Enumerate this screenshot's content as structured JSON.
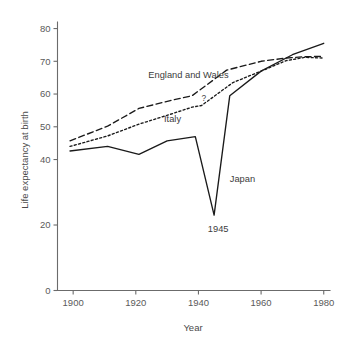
{
  "chart_data": {
    "type": "line",
    "title": "",
    "xlabel": "Year",
    "ylabel": "Life expectancy at birth",
    "xlim": [
      1895,
      1982
    ],
    "ylim": [
      0,
      82
    ],
    "grid": false,
    "legend_position": "inline-annotations",
    "xticks": [
      1900,
      1920,
      1940,
      1960,
      1980
    ],
    "xtick_labels": [
      "1900",
      "1920",
      "1940",
      "1960",
      "1980"
    ],
    "yticks": [
      0,
      20,
      40,
      50,
      60,
      70,
      80
    ],
    "ytick_labels": [
      "0",
      "20",
      "40",
      "50",
      "60",
      "70",
      "80"
    ],
    "series": [
      {
        "name": "England and Wales",
        "style": "dashed",
        "label_x": 1924,
        "label_y": 65.0,
        "x": [
          1899,
          1911,
          1921,
          1931,
          1938,
          1949,
          1960,
          1968,
          1974,
          1980
        ],
        "values": [
          45.7,
          50.2,
          55.6,
          58.0,
          59.5,
          67.3,
          70.0,
          71.0,
          71.4,
          71.5
        ]
      },
      {
        "name": "Italy",
        "style": "dotted",
        "label_x": 1929,
        "label_y": 51.5,
        "x": [
          1899,
          1911,
          1921,
          1931,
          1938,
          1941,
          1951,
          1960,
          1968,
          1974,
          1980
        ],
        "values": [
          44.0,
          47.2,
          50.8,
          53.8,
          56.0,
          56.5,
          63.5,
          67.0,
          70.2,
          71.2,
          71.0
        ]
      },
      {
        "name": "Japan",
        "style": "solid",
        "label_x": 1950,
        "label_y": 33.0,
        "x": [
          1899,
          1911,
          1921,
          1930,
          1939,
          1945,
          1950,
          1960,
          1970,
          1980
        ],
        "values": [
          42.6,
          44.0,
          41.6,
          45.7,
          47.0,
          23.0,
          59.5,
          67.0,
          72.0,
          75.5
        ]
      }
    ],
    "annotations": [
      {
        "text": "?",
        "x": 1941,
        "y": 57.8,
        "size": "small"
      },
      {
        "text": "1945",
        "x": 1943,
        "y": 18.0,
        "size": "normal"
      }
    ]
  }
}
